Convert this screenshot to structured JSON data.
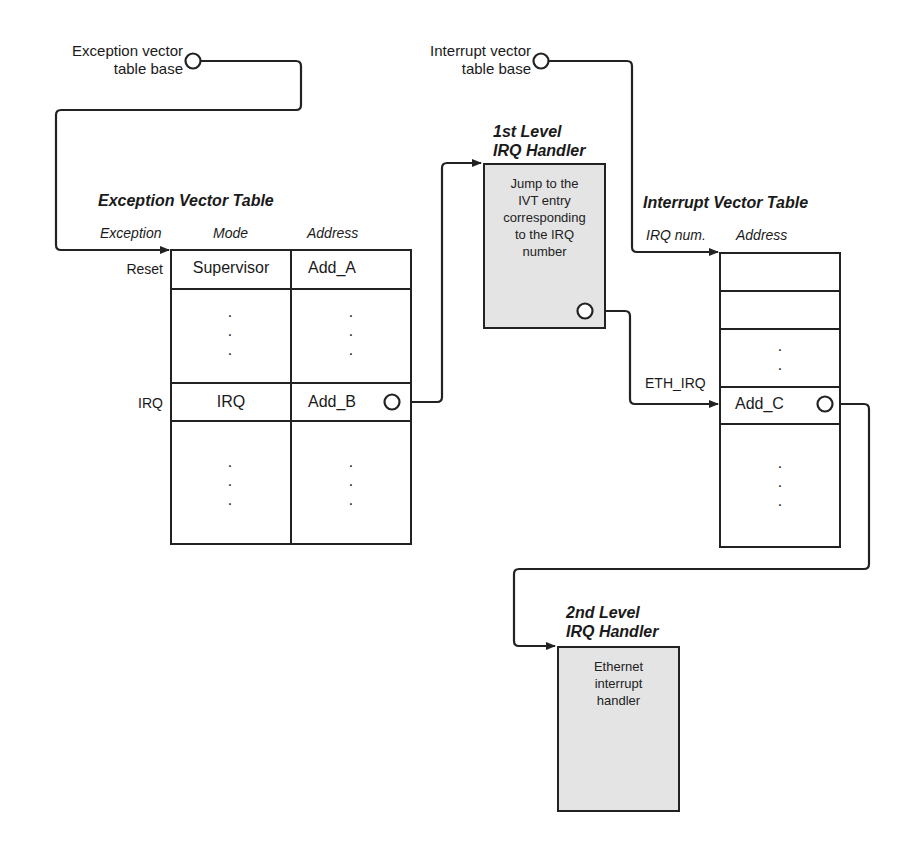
{
  "exception_base": {
    "label_line1": "Exception vector",
    "label_line2": "table base"
  },
  "interrupt_base": {
    "label_line1": "Interrupt vector",
    "label_line2": "table base"
  },
  "exception_vector_table": {
    "title": "Exception Vector Table",
    "columns": [
      "Exception",
      "Mode",
      "Address"
    ],
    "rows": [
      {
        "exception": "Reset",
        "mode": "Supervisor",
        "address": "Add_A"
      },
      {
        "exception": "",
        "mode": ":",
        "address": ":"
      },
      {
        "exception": "IRQ",
        "mode": "IRQ",
        "address": "Add_B"
      },
      {
        "exception": "",
        "mode": ":",
        "address": ":"
      }
    ],
    "ellipsis": "·\n·\n·"
  },
  "first_level_handler": {
    "title_line1": "1st Level",
    "title_line2": "IRQ Handler",
    "body": [
      "Jump to the",
      "IVT entry",
      "corresponding",
      "to the IRQ",
      "number"
    ]
  },
  "interrupt_vector_table": {
    "title": "Interrupt Vector Table",
    "columns": [
      "IRQ num.",
      "Address"
    ],
    "rows": [
      {
        "irq": "",
        "address": ""
      },
      {
        "irq": "",
        "address": ""
      },
      {
        "irq": "",
        "address": ":"
      },
      {
        "irq": "ETH_IRQ",
        "address": "Add_C"
      },
      {
        "irq": "",
        "address": ":"
      }
    ],
    "ellipsis_short": "·\n·",
    "ellipsis": "·\n·\n·"
  },
  "second_level_handler": {
    "title_line1": "2nd Level",
    "title_line2": "IRQ Handler",
    "body": [
      "Ethernet",
      "interrupt",
      "handler"
    ]
  },
  "colors": {
    "line": "#222222",
    "handler_fill": "#e4e4e4",
    "background": "#ffffff"
  }
}
